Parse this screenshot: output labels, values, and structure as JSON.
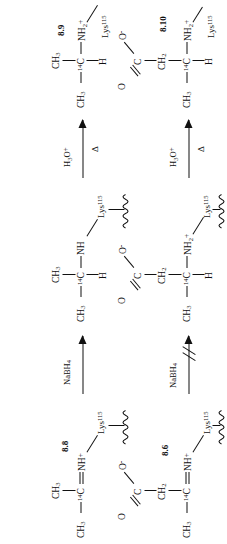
{
  "scheme": {
    "title": "Transamination / reductive amination reaction scheme",
    "orientation": "rotated-90",
    "background_color": "#ffffff",
    "line_color": "#111111"
  },
  "compounds": {
    "c86": {
      "id": "8.6",
      "role": "protonated Schiff base (imine) of oxaloacetate-type substrate",
      "labels": {
        "methyl": "CH",
        "methyl_sub": "3",
        "carbon14": "C",
        "carbon14_sup": "14",
        "imine_n": "NH",
        "imine_charge": "+",
        "ch2": "CH",
        "ch2_sub": "2",
        "carboxyl_c": "C",
        "carbonyl_o": "O",
        "oxide_o": "O",
        "oxide_charge": "-",
        "lys": "Lys",
        "lys_sup": "115"
      }
    },
    "c88": {
      "id": "8.8",
      "role": "protonated Schiff base (imine) of acetaldehyde-type substrate",
      "labels": {
        "methyl_left": "CH",
        "methyl_left_sub": "3",
        "carbon14": "C",
        "carbon14_sup": "14",
        "methyl_top": "CH",
        "methyl_top_sub": "3",
        "imine_n": "NH",
        "imine_charge": "+",
        "lys": "Lys",
        "lys_sup": "115"
      }
    },
    "amine_from_88": {
      "id": "",
      "role": "secondary amine produced by NaBH4 reduction of 8.8",
      "labels": {
        "h": "H",
        "methyl_left": "CH",
        "methyl_left_sub": "3",
        "carbon14": "C",
        "carbon14_sup": "14",
        "methyl_top": "CH",
        "methyl_top_sub": "3",
        "amine_n": "NH",
        "lys": "Lys",
        "lys_sup": "115"
      }
    },
    "amine_from_86": {
      "id": "",
      "role": "secondary ammonium produced by reduction (blocked pathway product)",
      "labels": {
        "h": "H",
        "methyl_left": "CH",
        "methyl_left_sub": "3",
        "carbon14": "C",
        "carbon14_sup": "14",
        "ch2": "CH",
        "ch2_sub": "2",
        "carboxyl_c": "C",
        "carbonyl_o": "O",
        "oxide_o": "O",
        "oxide_charge": "-",
        "amine_n": "NH",
        "amine_n_sub": "2",
        "amine_charge": "+",
        "lys": "Lys",
        "lys_sup": "115"
      }
    },
    "c89": {
      "id": "8.9",
      "role": "free amine released after acid hydrolysis",
      "labels": {
        "h": "H",
        "methyl_left": "CH",
        "methyl_left_sub": "3",
        "carbon14": "C",
        "carbon14_sup": "14",
        "methyl_top": "CH",
        "methyl_top_sub": "3",
        "amine_n": "NH",
        "amine_n_sub": "2",
        "amine_charge": "+",
        "lys": "Lys",
        "lys_sup": "115"
      }
    },
    "c810": {
      "id": "8.10",
      "role": "amino acid released after acid hydrolysis",
      "labels": {
        "h": "H",
        "methyl_left": "CH",
        "methyl_left_sub": "3",
        "carbon14": "C",
        "carbon14_sup": "14",
        "ch2": "CH",
        "ch2_sub": "2",
        "carboxyl_c": "C",
        "carbonyl_o": "O",
        "oxide_o": "O",
        "oxide_charge": "-",
        "amine_n": "NH",
        "amine_n_sub": "2",
        "amine_charge": "+",
        "lys": "Lys",
        "lys_sup": "115"
      }
    }
  },
  "arrows": {
    "nabh4_top": {
      "reagent": "NaBH",
      "reagent_sub": "4",
      "blocked": false
    },
    "nabh4_bottom": {
      "reagent": "NaBH",
      "reagent_sub": "4",
      "blocked": true,
      "blocked_note": "double slash — reaction does not occur"
    },
    "hydrolysis_top": {
      "reagent": "H",
      "reagent_sub": "3",
      "reagent_tail": "O",
      "reagent_charge": "+",
      "condition": "Δ"
    },
    "hydrolysis_bottom": {
      "reagent": "H",
      "reagent_sub": "3",
      "reagent_tail": "O",
      "reagent_charge": "+",
      "condition": "Δ"
    }
  }
}
